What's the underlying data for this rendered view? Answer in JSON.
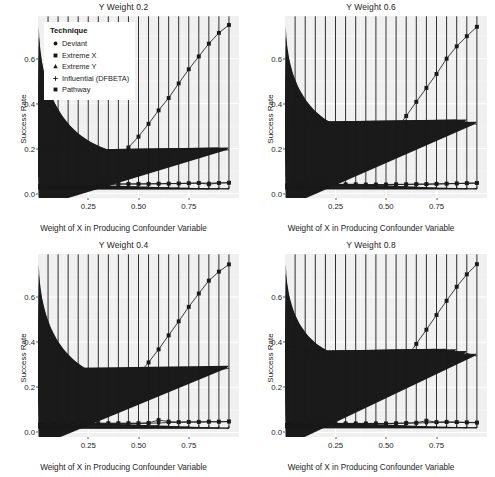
{
  "figure": {
    "panel_order": [
      "p02",
      "p06",
      "p04",
      "p08"
    ]
  },
  "legend": {
    "title": "Technique",
    "entries": [
      {
        "label": "Deviant",
        "marker": "circle-filled-icon"
      },
      {
        "label": "Extreme X",
        "marker": "square-filled-icon"
      },
      {
        "label": "Extreme Y",
        "marker": "triangle-filled-icon"
      },
      {
        "label": "Influential (DFBETA)",
        "marker": "plus-icon"
      },
      {
        "label": "Pathway",
        "marker": "square-filled-icon"
      }
    ]
  },
  "axes": {
    "xlabel": "Weight of X in Producing Confounder Variable",
    "ylabel": "Success Rate",
    "xticks": [
      "0.25",
      "0.50",
      "0.75"
    ],
    "xtick_values": [
      0.25,
      0.5,
      0.75
    ],
    "yticks": [
      "0.0",
      "0.2",
      "0.4",
      "0.6"
    ],
    "ytick_values": [
      0.0,
      0.2,
      0.4,
      0.6
    ],
    "xlim": [
      0.0,
      1.0
    ],
    "ylim": [
      -0.02,
      0.79
    ]
  },
  "colors": {
    "panel_background": "#f0f0f0",
    "grid_major": "#ffffff",
    "grid_minor": "#f7f7f7",
    "series": "#1a1a1a",
    "text": "#1c1c1c",
    "figure_background": "#ffffff"
  },
  "chart_data": [
    {
      "type": "line",
      "title": "Y Weight 0.2",
      "xlabel": "Weight of X in Producing Confounder Variable",
      "ylabel": "Success Rate",
      "xlim": [
        0.0,
        1.0
      ],
      "ylim": [
        -0.02,
        0.79
      ],
      "grid": true,
      "legend_position": "top-left-inside",
      "x": [
        0.05,
        0.1,
        0.15,
        0.2,
        0.25,
        0.3,
        0.35,
        0.4,
        0.45,
        0.5,
        0.55,
        0.6,
        0.65,
        0.7,
        0.75,
        0.8,
        0.85,
        0.9,
        0.95
      ],
      "series": [
        {
          "name": "Deviant",
          "marker": "circle",
          "values": [
            0.04,
            0.04,
            0.04,
            0.04,
            0.04,
            0.041,
            0.041,
            0.042,
            0.042,
            0.042,
            0.043,
            0.043,
            0.044,
            0.044,
            0.045,
            0.046,
            0.046,
            0.047,
            0.048
          ]
        },
        {
          "name": "Extreme X",
          "marker": "square",
          "values": [
            0.042,
            0.043,
            0.045,
            0.06,
            0.078,
            0.1,
            0.128,
            0.163,
            0.205,
            0.253,
            0.31,
            0.37,
            0.425,
            0.49,
            0.553,
            0.61,
            0.667,
            0.715,
            0.75
          ]
        },
        {
          "name": "Extreme Y",
          "marker": "triangle",
          "values": [
            0.072,
            0.074,
            0.076,
            0.08,
            0.085,
            0.092,
            0.1,
            0.11,
            0.12,
            0.13,
            0.14,
            0.15,
            0.158,
            0.166,
            0.174,
            0.182,
            0.19,
            0.194,
            0.194
          ]
        },
        {
          "name": "Influential (DFBETA)",
          "marker": "plus",
          "values": [
            0.04,
            0.04,
            0.039,
            0.038,
            0.037,
            0.035,
            0.034,
            0.032,
            0.031,
            0.029,
            0.028,
            0.026,
            0.025,
            0.024,
            0.023,
            0.022,
            0.021,
            0.021,
            0.021
          ]
        },
        {
          "name": "Pathway",
          "marker": "square",
          "values": [
            0.04,
            0.04,
            0.041,
            0.041,
            0.041,
            0.042,
            0.042,
            0.042,
            0.043,
            0.043,
            0.043,
            0.044,
            0.044,
            0.045,
            0.046,
            0.047,
            0.041,
            0.047,
            0.048
          ]
        }
      ]
    },
    {
      "type": "line",
      "title": "Y Weight 0.6",
      "xlabel": "Weight of X in Producing Confounder Variable",
      "ylabel": "Success Rate",
      "xlim": [
        0.0,
        1.0
      ],
      "ylim": [
        -0.02,
        0.79
      ],
      "grid": true,
      "legend_position": "none",
      "x": [
        0.05,
        0.1,
        0.15,
        0.2,
        0.25,
        0.3,
        0.35,
        0.4,
        0.45,
        0.5,
        0.55,
        0.6,
        0.65,
        0.7,
        0.75,
        0.8,
        0.85,
        0.9,
        0.95
      ],
      "series": [
        {
          "name": "Deviant",
          "marker": "circle",
          "values": [
            0.043,
            0.043,
            0.043,
            0.042,
            0.04,
            0.04,
            0.04,
            0.039,
            0.039,
            0.039,
            0.04,
            0.04,
            0.041,
            0.041,
            0.042,
            0.043,
            0.044,
            0.045,
            0.046
          ]
        },
        {
          "name": "Extreme X",
          "marker": "square",
          "values": [
            0.042,
            0.043,
            0.047,
            0.055,
            0.07,
            0.092,
            0.12,
            0.15,
            0.188,
            0.232,
            0.285,
            0.345,
            0.408,
            0.47,
            0.532,
            0.6,
            0.655,
            0.7,
            0.742
          ]
        },
        {
          "name": "Extreme Y",
          "marker": "triangle",
          "values": [
            0.177,
            0.186,
            0.194,
            0.202,
            0.21,
            0.216,
            0.224,
            0.233,
            0.24,
            0.248,
            0.256,
            0.264,
            0.276,
            0.286,
            0.292,
            0.308,
            0.318,
            0.318,
            0.308
          ]
        },
        {
          "name": "Influential (DFBETA)",
          "marker": "plus",
          "values": [
            0.042,
            0.042,
            0.041,
            0.04,
            0.039,
            0.038,
            0.037,
            0.036,
            0.035,
            0.034,
            0.032,
            0.03,
            0.028,
            0.026,
            0.024,
            0.023,
            0.022,
            0.021,
            0.021
          ]
        },
        {
          "name": "Pathway",
          "marker": "square",
          "values": [
            0.043,
            0.043,
            0.043,
            0.043,
            0.041,
            0.041,
            0.041,
            0.04,
            0.04,
            0.04,
            0.041,
            0.041,
            0.042,
            0.042,
            0.043,
            0.044,
            0.045,
            0.046,
            0.047
          ]
        }
      ]
    },
    {
      "type": "line",
      "title": "Y Weight 0.4",
      "xlabel": "Weight of X in Producing Confounder Variable",
      "ylabel": "Success Rate",
      "xlim": [
        0.0,
        1.0
      ],
      "ylim": [
        -0.02,
        0.79
      ],
      "grid": true,
      "legend_position": "none",
      "x": [
        0.05,
        0.1,
        0.15,
        0.2,
        0.25,
        0.3,
        0.35,
        0.4,
        0.45,
        0.5,
        0.55,
        0.6,
        0.65,
        0.7,
        0.75,
        0.8,
        0.85,
        0.9,
        0.95
      ],
      "series": [
        {
          "name": "Deviant",
          "marker": "circle",
          "values": [
            0.041,
            0.041,
            0.042,
            0.041,
            0.04,
            0.04,
            0.04,
            0.04,
            0.04,
            0.04,
            0.041,
            0.042,
            0.044,
            0.045,
            0.046,
            0.046,
            0.047,
            0.047,
            0.048
          ]
        },
        {
          "name": "Extreme X",
          "marker": "square",
          "values": [
            0.041,
            0.042,
            0.046,
            0.06,
            0.08,
            0.106,
            0.133,
            0.163,
            0.208,
            0.258,
            0.31,
            0.368,
            0.43,
            0.492,
            0.556,
            0.615,
            0.672,
            0.712,
            0.744
          ]
        },
        {
          "name": "Extreme Y",
          "marker": "triangle",
          "values": [
            0.137,
            0.142,
            0.15,
            0.157,
            0.163,
            0.17,
            0.178,
            0.185,
            0.193,
            0.202,
            0.212,
            0.222,
            0.232,
            0.244,
            0.254,
            0.265,
            0.274,
            0.278,
            0.284
          ]
        },
        {
          "name": "Influential (DFBETA)",
          "marker": "plus",
          "values": [
            0.041,
            0.041,
            0.04,
            0.039,
            0.038,
            0.037,
            0.036,
            0.035,
            0.034,
            0.032,
            0.03,
            0.029,
            0.027,
            0.025,
            0.024,
            0.022,
            0.021,
            0.02,
            0.019
          ]
        },
        {
          "name": "Pathway",
          "marker": "square",
          "values": [
            0.041,
            0.041,
            0.042,
            0.042,
            0.041,
            0.041,
            0.041,
            0.041,
            0.041,
            0.041,
            0.042,
            0.055,
            0.048,
            0.046,
            0.047,
            0.047,
            0.048,
            0.048,
            0.049
          ]
        }
      ]
    },
    {
      "type": "line",
      "title": "Y Weight 0.8",
      "xlabel": "Weight of X in Producing Confounder Variable",
      "ylabel": "Success Rate",
      "xlim": [
        0.0,
        1.0
      ],
      "ylim": [
        -0.02,
        0.79
      ],
      "grid": true,
      "legend_position": "none",
      "x": [
        0.05,
        0.1,
        0.15,
        0.2,
        0.25,
        0.3,
        0.35,
        0.4,
        0.45,
        0.5,
        0.55,
        0.6,
        0.65,
        0.7,
        0.75,
        0.8,
        0.85,
        0.9,
        0.95
      ],
      "series": [
        {
          "name": "Deviant",
          "marker": "circle",
          "values": [
            0.04,
            0.04,
            0.04,
            0.04,
            0.04,
            0.04,
            0.04,
            0.04,
            0.04,
            0.039,
            0.04,
            0.041,
            0.042,
            0.043,
            0.044,
            0.045,
            0.045,
            0.044,
            0.043
          ]
        },
        {
          "name": "Extreme X",
          "marker": "square",
          "values": [
            0.04,
            0.041,
            0.045,
            0.055,
            0.07,
            0.09,
            0.113,
            0.143,
            0.18,
            0.222,
            0.272,
            0.33,
            0.392,
            0.455,
            0.52,
            0.583,
            0.645,
            0.7,
            0.745
          ]
        },
        {
          "name": "Extreme Y",
          "marker": "triangle",
          "values": [
            0.222,
            0.232,
            0.244,
            0.258,
            0.27,
            0.28,
            0.29,
            0.298,
            0.306,
            0.312,
            0.318,
            0.33,
            0.346,
            0.358,
            0.36,
            0.36,
            0.358,
            0.35,
            0.338
          ]
        },
        {
          "name": "Influential (DFBETA)",
          "marker": "plus",
          "values": [
            0.04,
            0.04,
            0.039,
            0.039,
            0.038,
            0.037,
            0.036,
            0.035,
            0.034,
            0.033,
            0.031,
            0.029,
            0.027,
            0.025,
            0.024,
            0.023,
            0.022,
            0.021,
            0.021
          ]
        },
        {
          "name": "Pathway",
          "marker": "square",
          "values": [
            0.04,
            0.04,
            0.04,
            0.04,
            0.04,
            0.04,
            0.04,
            0.04,
            0.04,
            0.04,
            0.041,
            0.042,
            0.043,
            0.052,
            0.046,
            0.047,
            0.046,
            0.045,
            0.044
          ]
        }
      ]
    }
  ]
}
